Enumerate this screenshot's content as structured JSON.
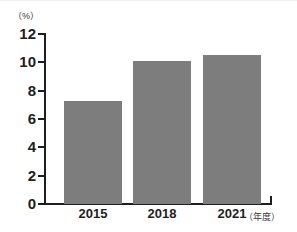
{
  "chart_data": {
    "type": "bar",
    "title": "",
    "subtitle": "",
    "categories": [
      "2015",
      "2018",
      "2021"
    ],
    "values": [
      7.3,
      10.1,
      10.55
    ],
    "series": [
      {
        "name": "",
        "values": [
          7.3,
          10.1,
          10.55
        ]
      }
    ],
    "xlabel": "（年度）",
    "ylabel": "（%）",
    "ylim": [
      0,
      12
    ],
    "yticks": [
      0,
      2,
      4,
      6,
      8,
      10,
      12
    ],
    "ytick_labels": [
      "0",
      "2",
      "4",
      "6",
      "8",
      "10",
      "12"
    ],
    "grid": false,
    "legend": null,
    "bar_color": "#7d7d7d",
    "axis_color": "#1e1e1e",
    "background_color": "#ffffff"
  },
  "axis": {
    "unit_label": "（%）",
    "x_axis_title": "（年度）"
  }
}
